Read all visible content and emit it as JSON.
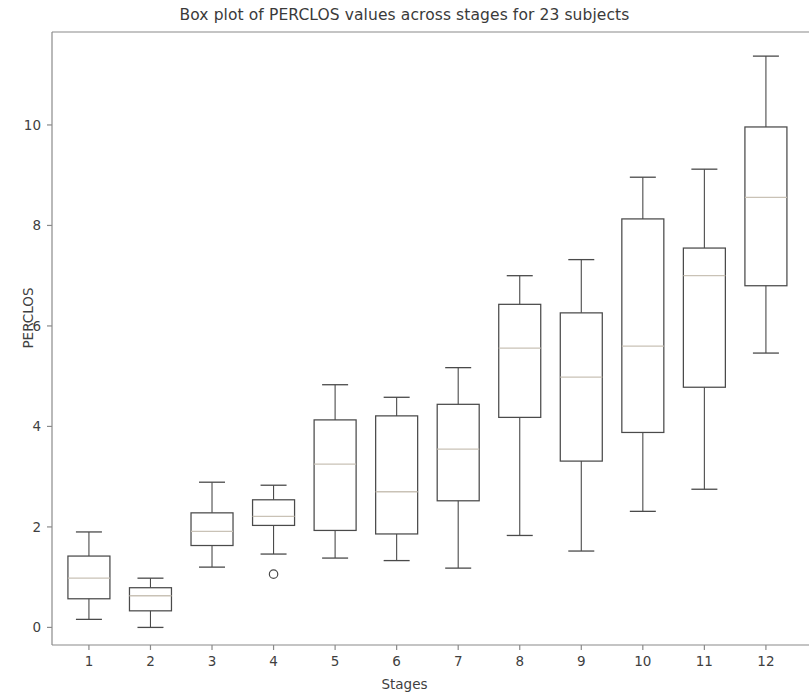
{
  "chart_data": {
    "type": "box",
    "title": "Box plot of PERCLOS values across stages for 23 subjects",
    "xlabel": "Stages",
    "ylabel": "PERCLOS",
    "categories": [
      "1",
      "2",
      "3",
      "4",
      "5",
      "6",
      "7",
      "8",
      "9",
      "10",
      "11",
      "12"
    ],
    "xtick_labels": [
      "1",
      "2",
      "3",
      "4",
      "5",
      "6",
      "7",
      "8",
      "9",
      "10",
      "11",
      "12"
    ],
    "ytick_labels": [
      "0",
      "2",
      "4",
      "6",
      "8",
      "10"
    ],
    "ytick_values": [
      0,
      2,
      4,
      6,
      8,
      10
    ],
    "ylim": [
      -0.35,
      11.85
    ],
    "xlim": [
      0.4,
      12.7
    ],
    "grid": false,
    "legend": null,
    "boxes": [
      {
        "stage": "1",
        "whisker_low": 0.16,
        "q1": 0.57,
        "median": 0.98,
        "q3": 1.42,
        "whisker_high": 1.9,
        "outliers": []
      },
      {
        "stage": "2",
        "whisker_low": 0.0,
        "q1": 0.33,
        "median": 0.63,
        "q3": 0.79,
        "whisker_high": 0.98,
        "outliers": []
      },
      {
        "stage": "3",
        "whisker_low": 1.2,
        "q1": 1.63,
        "median": 1.91,
        "q3": 2.28,
        "whisker_high": 2.89,
        "outliers": []
      },
      {
        "stage": "4",
        "whisker_low": 1.46,
        "q1": 2.03,
        "median": 2.21,
        "q3": 2.54,
        "whisker_high": 2.83,
        "outliers": [
          1.06
        ]
      },
      {
        "stage": "5",
        "whisker_low": 1.38,
        "q1": 1.93,
        "median": 3.25,
        "q3": 4.13,
        "whisker_high": 4.83,
        "outliers": []
      },
      {
        "stage": "6",
        "whisker_low": 1.33,
        "q1": 1.86,
        "median": 2.7,
        "q3": 4.21,
        "whisker_high": 4.58,
        "outliers": []
      },
      {
        "stage": "7",
        "whisker_low": 1.18,
        "q1": 2.52,
        "median": 3.55,
        "q3": 4.44,
        "whisker_high": 5.17,
        "outliers": []
      },
      {
        "stage": "8",
        "whisker_low": 1.83,
        "q1": 4.18,
        "median": 5.56,
        "q3": 6.43,
        "whisker_high": 7.0,
        "outliers": []
      },
      {
        "stage": "9",
        "whisker_low": 1.52,
        "q1": 3.31,
        "median": 4.98,
        "q3": 6.26,
        "whisker_high": 7.32,
        "outliers": []
      },
      {
        "stage": "10",
        "whisker_low": 2.31,
        "q1": 3.88,
        "median": 5.6,
        "q3": 8.13,
        "whisker_high": 8.96,
        "outliers": []
      },
      {
        "stage": "11",
        "whisker_low": 2.75,
        "q1": 4.78,
        "median": 7.0,
        "q3": 7.55,
        "whisker_high": 9.12,
        "outliers": []
      },
      {
        "stage": "12",
        "whisker_low": 5.46,
        "q1": 6.8,
        "median": 8.56,
        "q3": 9.96,
        "whisker_high": 11.37,
        "outliers": []
      }
    ],
    "colors": {
      "box_edge": "#4a4a4a",
      "median": "#c9c2b6",
      "whisker": "#4a4a4a",
      "cap": "#4a4a4a",
      "flier_edge": "#4a4a4a",
      "axis": "#8a8a8a",
      "text": "#3f3f3f",
      "background": "#ffffff"
    }
  }
}
